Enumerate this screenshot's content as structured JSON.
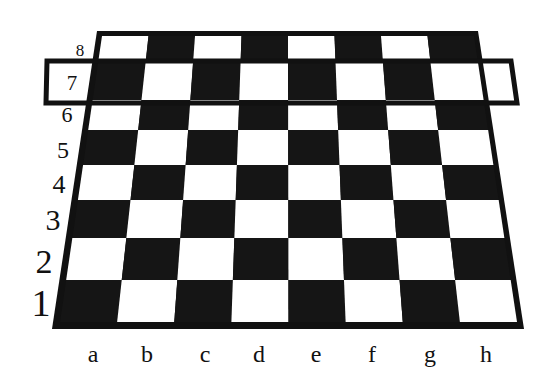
{
  "diagram": {
    "type": "chessboard-perspective",
    "files": [
      "a",
      "b",
      "c",
      "d",
      "e",
      "f",
      "g",
      "h"
    ],
    "ranks": [
      "8",
      "7",
      "6",
      "5",
      "4",
      "3",
      "2",
      "1"
    ],
    "highlighted_rank": "7",
    "colors": {
      "dark": "#151515",
      "light": "#ffffff",
      "frame": "#111111",
      "highlight_stroke": "#111111",
      "label": "#111111"
    },
    "frame_outer": {
      "top_left": [
        97,
        31
      ],
      "top_right": [
        478,
        31
      ],
      "bottom_right": [
        524,
        329
      ],
      "bottom_left": [
        52,
        329
      ]
    },
    "grid_inner": {
      "top_left": [
        102,
        36
      ],
      "top_right": [
        474,
        36
      ],
      "bottom_right": [
        517,
        322
      ],
      "bottom_left": [
        60,
        322
      ]
    },
    "rank_row_bottoms": [
      36,
      61,
      100,
      130,
      165,
      200,
      238,
      280,
      322
    ],
    "rank_label_positions": [
      {
        "label": "8",
        "x": 80,
        "y": 56,
        "size": 17
      },
      {
        "label": "7",
        "x": 72,
        "y": 90,
        "size": 21
      },
      {
        "label": "6",
        "x": 67,
        "y": 122,
        "size": 22
      },
      {
        "label": "5",
        "x": 63,
        "y": 158,
        "size": 24
      },
      {
        "label": "4",
        "x": 59,
        "y": 193,
        "size": 26
      },
      {
        "label": "3",
        "x": 53,
        "y": 230,
        "size": 30
      },
      {
        "label": "2",
        "x": 44,
        "y": 273,
        "size": 34
      },
      {
        "label": "1",
        "x": 41,
        "y": 316,
        "size": 38
      }
    ],
    "file_label_positions": [
      {
        "label": "a",
        "x": 93,
        "y": 362
      },
      {
        "label": "b",
        "x": 147,
        "y": 362
      },
      {
        "label": "c",
        "x": 205,
        "y": 362
      },
      {
        "label": "d",
        "x": 259,
        "y": 362
      },
      {
        "label": "e",
        "x": 316,
        "y": 362
      },
      {
        "label": "f",
        "x": 372,
        "y": 362
      },
      {
        "label": "g",
        "x": 430,
        "y": 362
      },
      {
        "label": "h",
        "x": 486,
        "y": 362
      }
    ],
    "highlight_box": {
      "rank": "7",
      "top_left": [
        47,
        61
      ],
      "top_right": [
        511,
        61
      ],
      "bottom_right": [
        517,
        103
      ],
      "bottom_left": [
        46,
        103
      ],
      "stroke_width": 5
    }
  }
}
